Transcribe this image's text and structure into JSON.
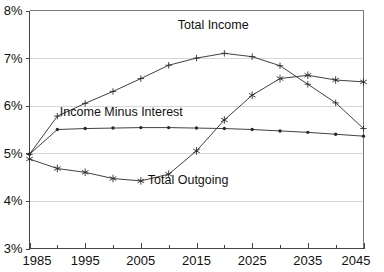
{
  "chart_data": {
    "type": "line",
    "title": "",
    "subtitle": "",
    "xlabel": "",
    "ylabel": "",
    "xlim": [
      1985,
      2045
    ],
    "ylim": [
      3,
      8
    ],
    "grid": true,
    "grid_axis": "y",
    "legend_position": "inline-annotations",
    "y_tick_labels": [
      "8%",
      "7%",
      "6%",
      "5%",
      "4%",
      "3%"
    ],
    "y_tick_values": [
      8,
      7,
      6,
      5,
      4,
      3
    ],
    "x_tick_labels": [
      "1985",
      "1995",
      "2005",
      "2015",
      "2025",
      "2035",
      "2045"
    ],
    "x_tick_values": [
      1985,
      1995,
      2005,
      2015,
      2025,
      2035,
      2045
    ],
    "x_minor_ticks": [
      1990,
      2000,
      2010,
      2020,
      2030,
      2040
    ],
    "x": [
      1985,
      1990,
      1995,
      2000,
      2005,
      2010,
      2015,
      2020,
      2025,
      2030,
      2035,
      2040,
      2045
    ],
    "series": [
      {
        "name": "Total Income",
        "marker": "plus",
        "label_text": "Total Income",
        "label_x": 2018,
        "label_y": 7.62,
        "values": [
          4.98,
          5.78,
          6.05,
          6.3,
          6.57,
          6.85,
          7.0,
          7.1,
          7.03,
          6.84,
          6.45,
          6.06,
          5.52
        ]
      },
      {
        "name": "Income Minus Interest",
        "marker": "dot",
        "label_text": "Income Minus Interest",
        "label_x": 2001.5,
        "label_y": 5.78,
        "values": [
          4.98,
          5.5,
          5.52,
          5.53,
          5.54,
          5.54,
          5.53,
          5.52,
          5.5,
          5.47,
          5.44,
          5.4,
          5.36
        ]
      },
      {
        "name": "Total Outgoing",
        "marker": "star",
        "label_text": "Total Outgoing",
        "label_x": 2013.5,
        "label_y": 4.35,
        "values": [
          4.88,
          4.68,
          4.6,
          4.47,
          4.42,
          4.56,
          5.05,
          5.7,
          6.22,
          6.57,
          6.64,
          6.54,
          6.5
        ]
      }
    ]
  },
  "axes": {
    "y_axis_name": "percent-axis",
    "x_axis_name": "year-axis"
  }
}
